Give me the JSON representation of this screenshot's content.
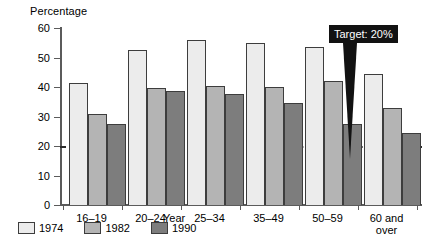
{
  "chart_data": {
    "type": "bar",
    "title": "",
    "ylabel": "Percentage",
    "xlabel": "Year",
    "ylim": [
      0,
      60
    ],
    "yticks": [
      0,
      10,
      20,
      30,
      40,
      50,
      60
    ],
    "grid": false,
    "legend_position": "bottom-left",
    "categories": [
      "16–19",
      "20–24",
      "25–34",
      "35–49",
      "50–59",
      "60 and\nover"
    ],
    "series": [
      {
        "name": "1974",
        "color": "#ececec",
        "values": [
          41.5,
          52.5,
          56.0,
          55.0,
          53.5,
          44.5
        ]
      },
      {
        "name": "1982",
        "color": "#b4b4b4",
        "values": [
          31.0,
          39.5,
          40.5,
          40.0,
          42.0,
          33.0
        ]
      },
      {
        "name": "1990",
        "color": "#7d7d7d",
        "values": [
          27.5,
          38.5,
          37.5,
          34.5,
          27.5,
          24.5
        ]
      }
    ],
    "annotations": [
      {
        "label": "Target: 20%",
        "value": 20,
        "style": "dashed-line-with-callout"
      }
    ]
  },
  "axis": {
    "y_title": "Percentage",
    "x_title": "Year",
    "tick_labels": [
      "60",
      "50",
      "40",
      "30",
      "20",
      "10",
      "0"
    ]
  },
  "callout": {
    "text": "Target: 20%"
  },
  "legend": {
    "items": [
      {
        "label": "1974"
      },
      {
        "label": "1982"
      },
      {
        "label": "1990"
      }
    ]
  },
  "categories": [
    {
      "label": "16–19"
    },
    {
      "label": "20–24"
    },
    {
      "label": "25–34"
    },
    {
      "label": "35–49"
    },
    {
      "label": "50–59"
    },
    {
      "label": "60 and\nover"
    }
  ]
}
